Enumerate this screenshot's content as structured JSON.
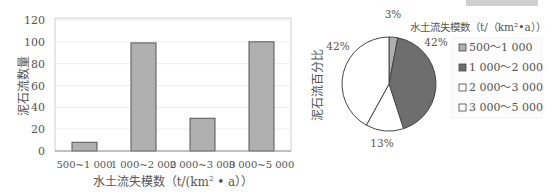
{
  "chart_data": [
    {
      "type": "bar",
      "title": "",
      "xlabel": "水土流失模数 (t/(km²·a))",
      "ylabel": "泥石流数量",
      "categories": [
        "500~1 000",
        "1 000~2 000",
        "2 000~3 000",
        "3 000~5 000"
      ],
      "values": [
        8,
        99,
        30,
        100
      ],
      "ylim": [
        0,
        120
      ],
      "yticks": [
        0,
        20,
        40,
        60,
        80,
        100,
        120
      ],
      "grid": true,
      "bar_color": "#b0b0b0",
      "legend": null
    },
    {
      "type": "pie",
      "title": "",
      "ylabel": "泥石流百分比",
      "legend_title": "水土流失模数 (t/(km²·a))",
      "categories": [
        "500~1 000",
        "1 000~2 000",
        "2 000~3 000",
        "3 000~5 000"
      ],
      "values": [
        3,
        42,
        13,
        42
      ],
      "labels": [
        "3%",
        "42%",
        "13%",
        "42%"
      ],
      "colors": [
        "#b0b0b0",
        "#6e6e6e",
        "#ffffff",
        "#ffffff"
      ],
      "legend_position": "right"
    }
  ],
  "bar_chart": {
    "ylabel": "泥石流数量",
    "xlabel_main": "水土流失模数（t/(km",
    "xlabel_sup": "2",
    "xlabel_tail": " • a））",
    "yticks": [
      "0",
      "20",
      "40",
      "60",
      "80",
      "100",
      "120"
    ],
    "categories": [
      "500~1 000",
      "1 000~2 000",
      "2 000~3 000",
      "3 000~5 000"
    ]
  },
  "pie_chart": {
    "ylabel": "泥石流百分比",
    "legend_title": "水土流失模数（t/（km²•a））",
    "labels": [
      "3%",
      "42%",
      "13%",
      "42%"
    ],
    "legend_items": [
      "500～1 000",
      "1 000～2 000",
      "2 000～3 000",
      "3 000～5 000"
    ]
  }
}
